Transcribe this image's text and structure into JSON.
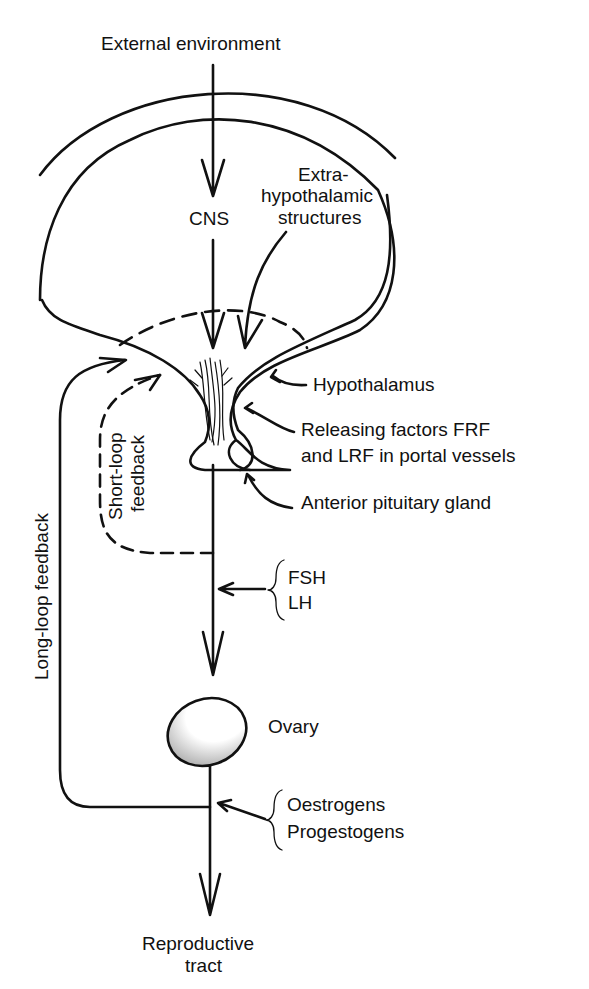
{
  "diagram": {
    "type": "flow",
    "colors": {
      "stroke": "#111111",
      "background": "#ffffff"
    },
    "labels": {
      "external": "External environment",
      "cns": "CNS",
      "extra1": "Extra-",
      "extra2": "hypothalamic",
      "extra3": "structures",
      "hypothalamus": "Hypothalamus",
      "rf1": "Releasing factors FRF",
      "rf2": "and LRF in portal vessels",
      "pituitary": "Anterior pituitary gland",
      "fsh": "FSH",
      "lh": "LH",
      "ovary": "Ovary",
      "oestrogens": "Oestrogens",
      "progestogens": "Progestogens",
      "repro1": "Reproductive",
      "repro2": "tract",
      "short1": "Short-loop",
      "short2": "feedback",
      "long": "Long-loop feedback"
    },
    "nodes": [
      "External environment",
      "CNS",
      "Extra-hypothalamic structures",
      "Hypothalamus",
      "Anterior pituitary gland",
      "Ovary",
      "Reproductive tract"
    ],
    "edges": [
      {
        "from": "External environment",
        "to": "CNS"
      },
      {
        "from": "CNS",
        "to": "Hypothalamus"
      },
      {
        "from": "Extra-hypothalamic structures",
        "to": "Hypothalamus"
      },
      {
        "from": "Hypothalamus",
        "to": "Anterior pituitary gland",
        "label": "Releasing factors FRF and LRF in portal vessels"
      },
      {
        "from": "Anterior pituitary gland",
        "to": "Ovary",
        "label": "FSH, LH"
      },
      {
        "from": "Anterior pituitary gland",
        "to": "Hypothalamus",
        "label": "Short-loop feedback",
        "style": "dashed"
      },
      {
        "from": "Ovary",
        "to": "Reproductive tract",
        "label": "Oestrogens, Progestogens"
      },
      {
        "from": "Ovary",
        "to": "Hypothalamus",
        "label": "Long-loop feedback"
      }
    ]
  }
}
